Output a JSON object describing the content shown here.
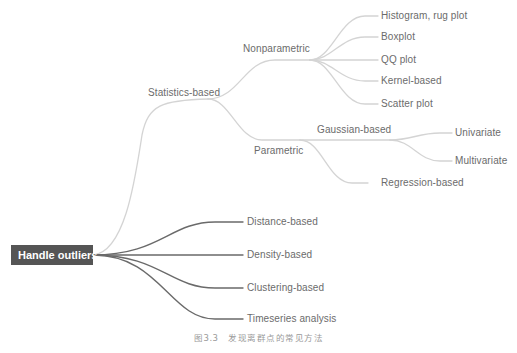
{
  "diagram": {
    "type": "mind-map",
    "colors": {
      "root_bg": "#555555",
      "root_text": "#ffffff",
      "light_branch": "#d4d4d4",
      "dark_branch": "#6a6a6a",
      "label_text": "#6b6b6b",
      "caption_text": "#9a9a9a"
    },
    "root": {
      "label": "Handle outliers"
    },
    "statistics": {
      "label": "Statistics-based",
      "nonparametric": {
        "label": "Nonparametric",
        "children": [
          {
            "label": "Histogram, rug plot"
          },
          {
            "label": "Boxplot"
          },
          {
            "label": "QQ plot"
          },
          {
            "label": "Kernel-based"
          },
          {
            "label": "Scatter plot"
          }
        ]
      },
      "parametric": {
        "label": "Parametric",
        "gaussian": {
          "label": "Gaussian-based",
          "children": [
            {
              "label": "Univariate"
            },
            {
              "label": "Multivariate"
            }
          ]
        },
        "regression": {
          "label": "Regression-based"
        }
      }
    },
    "other_methods": [
      {
        "label": "Distance-based"
      },
      {
        "label": "Density-based"
      },
      {
        "label": "Clustering-based"
      },
      {
        "label": "Timeseries analysis"
      }
    ],
    "caption": "图3.3　发现离群点的常见方法"
  }
}
